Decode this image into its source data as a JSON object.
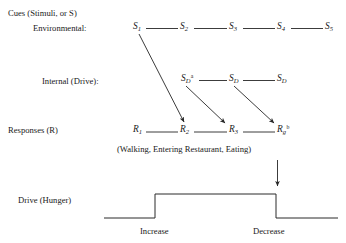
{
  "figure": {
    "row_labels": {
      "cues_heading": "Cues (Stimuli, or S)",
      "environmental": "Environmental:",
      "internal": "Internal (Drive):",
      "responses": "Responses (R)",
      "drive": "Drive (Hunger)"
    },
    "environmental_nodes": [
      {
        "base": "S",
        "sub": "1",
        "sup": ""
      },
      {
        "base": "S",
        "sub": "2",
        "sup": ""
      },
      {
        "base": "S",
        "sub": "3",
        "sup": ""
      },
      {
        "base": "S",
        "sub": "4",
        "sup": ""
      },
      {
        "base": "S",
        "sub": "5",
        "sup": ""
      }
    ],
    "internal_nodes": [
      {
        "base": "S",
        "sub": "D",
        "sup": "a"
      },
      {
        "base": "S",
        "sub": "D",
        "sup": ""
      },
      {
        "base": "S",
        "sub": "D",
        "sup": ""
      }
    ],
    "response_nodes": [
      {
        "base": "R",
        "sub": "1",
        "sup": ""
      },
      {
        "base": "R",
        "sub": "2",
        "sup": ""
      },
      {
        "base": "R",
        "sub": "3",
        "sup": ""
      },
      {
        "base": "R",
        "sub": "g",
        "sup": "b"
      }
    ],
    "response_caption": "(Walking, Entering Restaurant, Eating)",
    "drive_axis_labels": {
      "increase": "Increase",
      "decrease": "Decrease"
    },
    "colors": {
      "ink": "#1a1a1a",
      "line": "#262626",
      "background": "#ffffff"
    }
  }
}
